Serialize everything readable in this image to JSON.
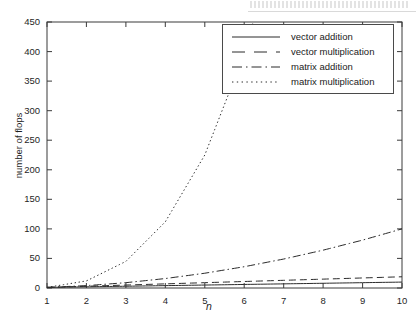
{
  "chart_data": {
    "type": "line",
    "title": "",
    "xlabel": "n",
    "ylabel": "number of flops",
    "xlim": [
      1,
      10
    ],
    "ylim": [
      0,
      450
    ],
    "xticks": [
      1,
      2,
      3,
      4,
      5,
      6,
      7,
      8,
      9,
      10
    ],
    "yticks": [
      0,
      50,
      100,
      150,
      200,
      250,
      300,
      350,
      400,
      450
    ],
    "grid": false,
    "legend_position": "top-right",
    "x": [
      1,
      2,
      3,
      4,
      5,
      6,
      7,
      8,
      9,
      10
    ],
    "series": [
      {
        "name": "vector addition",
        "style": "solid",
        "color": "#2b2b2b",
        "values": [
          1,
          2,
          3,
          4,
          5,
          6,
          7,
          8,
          9,
          10
        ]
      },
      {
        "name": "vector multiplication",
        "style": "dashed",
        "color": "#2b2b2b",
        "values": [
          1,
          3,
          5,
          7,
          9,
          11,
          13,
          15,
          17,
          19
        ]
      },
      {
        "name": "matrix addition",
        "style": "dashdot",
        "color": "#2b2b2b",
        "values": [
          1,
          4,
          9,
          16,
          25,
          36,
          49,
          64,
          81,
          100
        ]
      },
      {
        "name": "matrix multiplication",
        "style": "dotted",
        "color": "#2b2b2b",
        "values": [
          1,
          12,
          45,
          112,
          225,
          396,
          637,
          960,
          1377,
          1900
        ]
      }
    ]
  },
  "axes": {
    "ytick_labels": [
      "450",
      "400",
      "350",
      "300",
      "250",
      "200",
      "150",
      "100",
      "50",
      "0"
    ],
    "xtick_labels": [
      "1",
      "2",
      "3",
      "4",
      "5",
      "6",
      "7",
      "8",
      "9",
      "10"
    ],
    "ylabel": "number of flops",
    "xlabel": "n"
  },
  "legend": {
    "items": [
      {
        "label": "vector addition",
        "style": "solid"
      },
      {
        "label": "vector multiplication",
        "style": "dashed"
      },
      {
        "label": "matrix addition",
        "style": "dashdot"
      },
      {
        "label": "matrix multiplication",
        "style": "dotted"
      }
    ]
  },
  "colors": {
    "axis": "#3a3a3a",
    "curve": "#2b2b2b",
    "background": "#ffffff",
    "text": "#1a1a1a"
  }
}
